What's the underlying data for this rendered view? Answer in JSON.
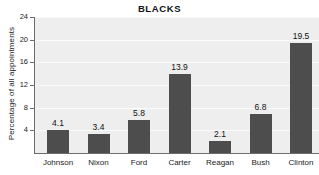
{
  "chart_data": {
    "type": "bar",
    "title": "BLACKS",
    "xlabel": "",
    "ylabel": "Percentage of all appointments",
    "categories": [
      "Johnson",
      "Nixon",
      "Ford",
      "Carter",
      "Reagan",
      "Bush",
      "Clinton"
    ],
    "values": [
      4.1,
      3.4,
      5.8,
      13.9,
      2.1,
      6.8,
      19.5
    ],
    "value_labels": [
      "4.1",
      "3.4",
      "5.8",
      "13.9",
      "2.1",
      "6.8",
      "19.5"
    ],
    "ylim": [
      0,
      24
    ],
    "yticks": [
      4,
      8,
      12,
      16,
      20,
      24
    ],
    "ytick_labels": [
      "4",
      "8",
      "12",
      "16",
      "20",
      "24"
    ],
    "grid": true,
    "legend": null,
    "bar_color": "#4d4d4d",
    "plot_background": "#eeeeee",
    "gridline_color": "#fbfbfb",
    "axis_color": "#6d6d6d"
  }
}
